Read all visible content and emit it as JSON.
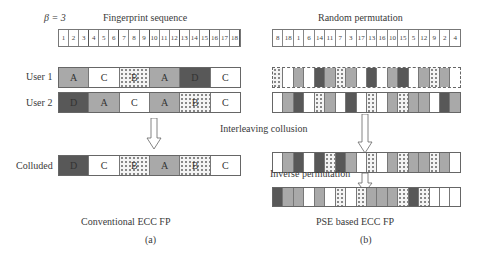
{
  "beta_label": "β = 3",
  "left_panel": {
    "title": "Fingerprint sequence",
    "positions": [
      "1",
      "2",
      "3",
      "4",
      "5",
      "6",
      "7",
      "8",
      "9",
      "10",
      "11",
      "12",
      "13",
      "14",
      "15",
      "16",
      "17",
      "18"
    ],
    "rows": [
      {
        "label": "User 1",
        "cells": [
          {
            "t": "A",
            "f": "L"
          },
          {
            "t": "C",
            "f": "W"
          },
          {
            "t": "B",
            "f": "P"
          },
          {
            "t": "A",
            "f": "L"
          },
          {
            "t": "D",
            "f": "D"
          },
          {
            "t": "C",
            "f": "W"
          }
        ]
      },
      {
        "label": "User 2",
        "cells": [
          {
            "t": "D",
            "f": "D"
          },
          {
            "t": "A",
            "f": "L"
          },
          {
            "t": "C",
            "f": "W"
          },
          {
            "t": "A",
            "f": "L"
          },
          {
            "t": "B",
            "f": "P"
          },
          {
            "t": "C",
            "f": "W"
          }
        ]
      }
    ],
    "colluded": {
      "label": "Colluded",
      "cells": [
        {
          "t": "D",
          "f": "D"
        },
        {
          "t": "C",
          "f": "W"
        },
        {
          "t": "B",
          "f": "P"
        },
        {
          "t": "A",
          "f": "L"
        },
        {
          "t": "B",
          "f": "P"
        },
        {
          "t": "C",
          "f": "W"
        }
      ]
    },
    "caption": "Conventional ECC FP",
    "sublabel": "(a)"
  },
  "right_panel": {
    "title": "Random permutation",
    "positions": [
      "8",
      "18",
      "1",
      "6",
      "14",
      "11",
      "7",
      "3",
      "17",
      "13",
      "16",
      "10",
      "15",
      "5",
      "12",
      "9",
      "2",
      "4"
    ],
    "permuted_user1": [
      "P",
      "W",
      "L",
      "W",
      "D",
      "L",
      "P",
      "L",
      "W",
      "D",
      "W",
      "L",
      "D",
      "W",
      "L",
      "P",
      "L",
      "W"
    ],
    "permuted_user2": [
      "W",
      "L",
      "D",
      "W",
      "P",
      "L",
      "W",
      "D",
      "W",
      "P",
      "W",
      "L",
      "P",
      "L",
      "L",
      "W",
      "D",
      "L"
    ],
    "interleaving_label": "Interleaving collusion",
    "interleaved": [
      "W",
      "L",
      "D",
      "W",
      "D",
      "P",
      "D",
      "L",
      "W",
      "P",
      "W",
      "L",
      "P",
      "L",
      "L",
      "P",
      "L",
      "W"
    ],
    "inverse_label": "Inverse permutation",
    "inverse": [
      "D",
      "L",
      "L",
      "W",
      "L",
      "W",
      "P",
      "W",
      "P",
      "L",
      "L",
      "L",
      "P",
      "D",
      "P",
      "W",
      "W",
      "W"
    ],
    "caption": "PSE based ECC FP",
    "sublabel": "(b)"
  },
  "legend_fills": {
    "W": "#ffffff",
    "L": "#a9a9a9",
    "D": "#585858",
    "P": "dotted"
  }
}
